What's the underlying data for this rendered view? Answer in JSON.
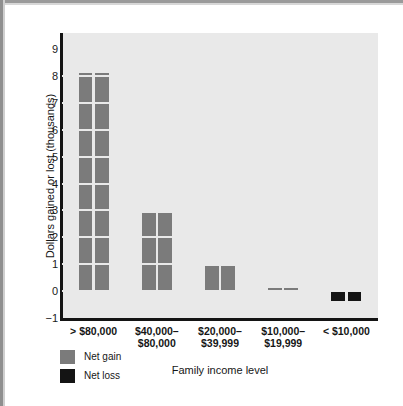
{
  "chart_data": {
    "type": "bar",
    "title": "",
    "xlabel": "Family income level",
    "ylabel": "Dollars gained or lost (thousands)",
    "categories": [
      "> $80,000",
      "$40,000–$80,000",
      "$20,000–$39,999",
      "$10,000–$19,999",
      "< $10,000"
    ],
    "category_lines": [
      [
        "> $80,000",
        ""
      ],
      [
        "$40,000–",
        "$80,000"
      ],
      [
        "$20,000–",
        "$39,999"
      ],
      [
        "$10,000–",
        "$19,999"
      ],
      [
        "< $10,000",
        ""
      ]
    ],
    "values": [
      8.1,
      2.9,
      0.95,
      0.1,
      -0.35
    ],
    "bar_kinds": [
      "gain",
      "gain",
      "gain",
      "gain",
      "loss"
    ],
    "ylim": [
      -1,
      9.6
    ],
    "yticks": [
      9,
      8,
      7,
      6,
      5,
      4,
      3,
      2,
      1,
      0,
      -1
    ],
    "ytick_labels": [
      "9",
      "8",
      "7",
      "6",
      "5",
      "4",
      "3",
      "2",
      "1",
      "0",
      "−1"
    ],
    "gridlines": [
      8,
      7,
      6,
      5,
      4,
      3,
      2,
      1,
      0
    ],
    "grid": true,
    "legend_position": "bottom-left",
    "legend": [
      {
        "label": "Net gain",
        "color": "#7b7b7b",
        "key": "gain"
      },
      {
        "label": "Net loss",
        "color": "#141414",
        "key": "loss"
      }
    ],
    "colors": {
      "net_gain": "#7b7b7b",
      "net_loss": "#141414",
      "panel_background": "#e9e9e9",
      "axis": "#141414",
      "page_background": "#ffffff"
    }
  },
  "axis": {
    "y_title": "Dollars gained or lost (thousands)",
    "x_title": "Family income level"
  }
}
